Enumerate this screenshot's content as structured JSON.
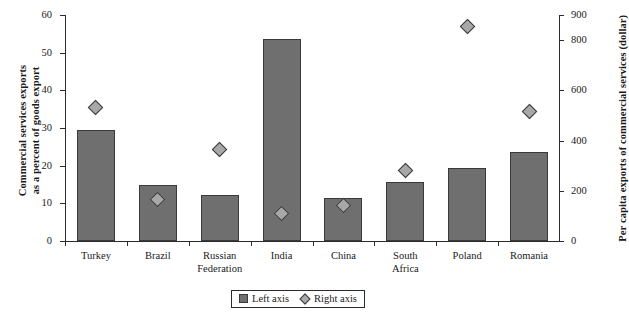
{
  "chart_data": {
    "type": "bar",
    "title": "",
    "categories": [
      "Turkey",
      "Brazil",
      "Russian\nFederation",
      "India",
      "China",
      "South\nAfrica",
      "Poland",
      "Romania"
    ],
    "series": [
      {
        "name": "Left axis",
        "type": "bar",
        "axis": "left",
        "values": [
          29.6,
          14.9,
          12.3,
          53.5,
          11.4,
          15.6,
          19.4,
          23.5
        ]
      },
      {
        "name": "Right axis",
        "type": "scatter",
        "axis": "right",
        "values": [
          530,
          165,
          365,
          110,
          140,
          280,
          855,
          515
        ]
      }
    ],
    "xlabel": "",
    "ylabel": "Commercial services exports\nas a percent of goods export",
    "y2label": "Per capita exports of commercial services (dollar)",
    "ylim": [
      0,
      60
    ],
    "y2lim": [
      0,
      900
    ],
    "yticks": [
      "0",
      "10",
      "20",
      "30",
      "40",
      "50",
      "60"
    ],
    "y2ticks": [
      "0",
      "200",
      "400",
      "600",
      "800",
      "900"
    ],
    "ytick_values": [
      0,
      10,
      20,
      30,
      40,
      50,
      60
    ],
    "y2tick_values": [
      0,
      200,
      400,
      600,
      800,
      900
    ],
    "grid": false,
    "legend_position": "bottom-center",
    "legend": [
      "Left axis",
      "Right axis"
    ],
    "colors": {
      "bar": "#6f6f6f",
      "bar_edge": "#3a3a3a",
      "marker": "#a8a8a8",
      "marker_edge": "#3a3a3a",
      "axis": "#2b2b2b",
      "background": "#ffffff"
    }
  }
}
